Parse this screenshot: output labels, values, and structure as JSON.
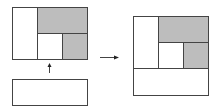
{
  "diagram": {
    "colors": {
      "stroke": "#444444",
      "shaded": "#bdbdbd",
      "empty": "#ffffff"
    },
    "left_layout": {
      "outer": {
        "x": 12,
        "y": 7,
        "w": 75,
        "h": 52
      },
      "cells": [
        {
          "id": "left-column",
          "x": 12,
          "y": 7,
          "w": 25,
          "h": 52,
          "shaded": false
        },
        {
          "id": "top-right-wide",
          "x": 37,
          "y": 7,
          "w": 50,
          "h": 26,
          "shaded": true
        },
        {
          "id": "center-small",
          "x": 37,
          "y": 33,
          "w": 25,
          "h": 26,
          "shaded": false
        },
        {
          "id": "bottom-right-small",
          "x": 62,
          "y": 33,
          "w": 25,
          "h": 26,
          "shaded": true
        }
      ]
    },
    "bottom_panel": {
      "x": 12,
      "y": 79,
      "w": 75,
      "h": 26,
      "shaded": false
    },
    "up_arrow": {
      "x": 49,
      "y1": 73,
      "y2": 63
    },
    "right_arrow": {
      "x1": 100,
      "x2": 119,
      "y": 57
    },
    "right_layout": {
      "outer": {
        "x": 133,
        "y": 16,
        "w": 75,
        "h": 79
      },
      "cells": [
        {
          "id": "left-column",
          "x": 133,
          "y": 16,
          "w": 25,
          "h": 52,
          "shaded": false
        },
        {
          "id": "top-right-wide",
          "x": 158,
          "y": 16,
          "w": 50,
          "h": 26,
          "shaded": true
        },
        {
          "id": "center-small",
          "x": 158,
          "y": 42,
          "w": 25,
          "h": 26,
          "shaded": false
        },
        {
          "id": "bottom-right-small",
          "x": 183,
          "y": 42,
          "w": 25,
          "h": 26,
          "shaded": true
        },
        {
          "id": "bottom-full-width",
          "x": 133,
          "y": 68,
          "w": 75,
          "h": 27,
          "shaded": false
        }
      ]
    }
  }
}
